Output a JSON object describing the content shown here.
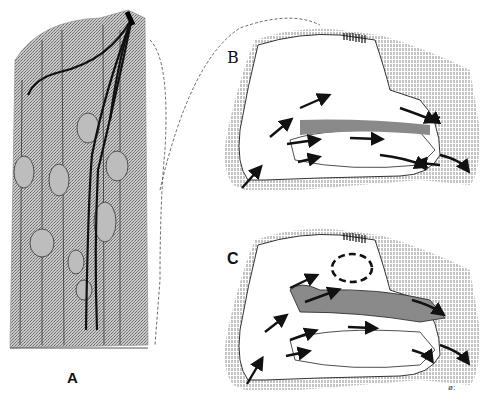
{
  "figure": {
    "panels": [
      {
        "id": "A",
        "label": "A",
        "subject": "olfactory epithelium cells (histology)"
      },
      {
        "id": "B",
        "label": "B",
        "subject": "nasal cavity airflow, normal breathing"
      },
      {
        "id": "C",
        "label": "C",
        "subject": "nasal cavity airflow, sniffing with eddy currents"
      }
    ],
    "signature": "ø:",
    "colors": {
      "ink": "#111111",
      "stipple": "#9a9a9a",
      "background": "#ffffff"
    }
  }
}
